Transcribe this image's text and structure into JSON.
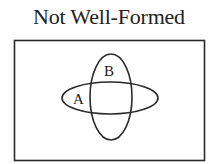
{
  "title": "Not Well-Formed",
  "diagram": {
    "type": "venn",
    "universe": {
      "x": 14,
      "y": 40,
      "width": 190,
      "height": 120
    },
    "sets": [
      {
        "label": "A",
        "shape": "ellipse",
        "cx": 110,
        "cy": 98,
        "rx": 48,
        "ry": 16,
        "label_x": 73,
        "label_y": 104
      },
      {
        "label": "B",
        "shape": "ellipse",
        "cx": 111,
        "cy": 97,
        "rx": 21,
        "ry": 43,
        "label_x": 104,
        "label_y": 76
      }
    ],
    "stroke_color": "#2a2a2a"
  }
}
